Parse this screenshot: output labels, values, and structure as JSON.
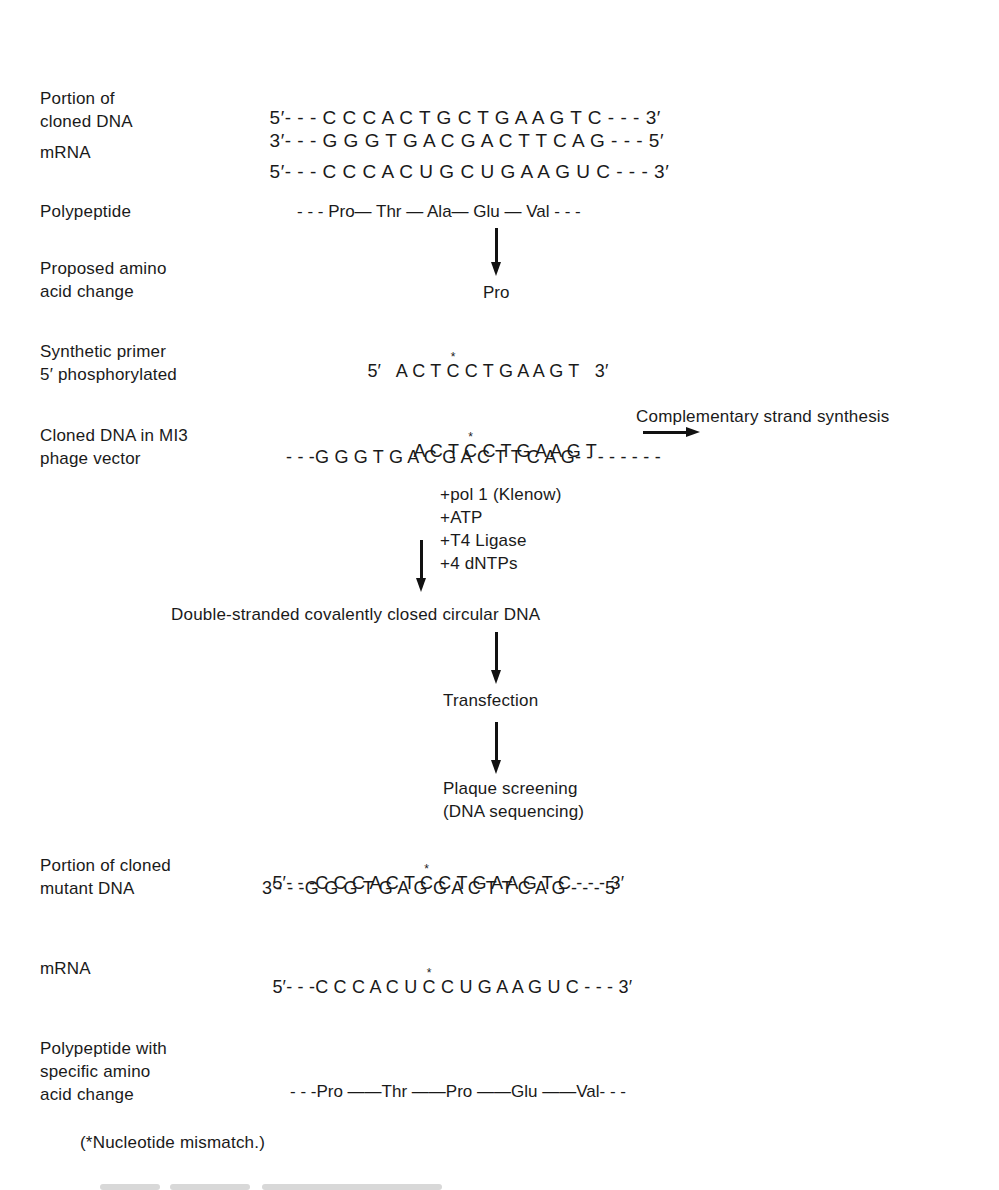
{
  "section1": {
    "label_line1": "Portion of",
    "label_line2": "cloned DNA",
    "strand_top": {
      "prefix": "5′- - - ",
      "bases": "C C C A C T G C T G A A G T C",
      "suffix": " - - - 3′"
    },
    "strand_bottom": {
      "prefix": "3′- - - ",
      "bases": "G G G T G A C G A C T T C A G",
      "suffix": " - - - 5′"
    }
  },
  "section2": {
    "label": "mRNA",
    "strand": {
      "prefix": "5′- - - ",
      "bases": "C C C A C U G C U G A A G U C",
      "suffix": " - - - 3′"
    }
  },
  "section3": {
    "label": "Polypeptide",
    "chain": "- - - Pro— Thr — Ala— Glu — Val - - -",
    "residues": [
      "Pro",
      "Thr",
      "Ala",
      "Glu",
      "Val"
    ]
  },
  "section4": {
    "label_line1": "Proposed amino",
    "label_line2": "acid change",
    "new_residue": "Pro"
  },
  "section5": {
    "label_line1": "Synthetic primer",
    "label_line2": "5′ phosphorylated",
    "five_prime": "5′",
    "bases_before": "A C T ",
    "mismatch_base": "C",
    "bases_after": " C T G A A G T",
    "three_prime": "3′"
  },
  "section6": {
    "label_line1": "Cloned DNA in MI3",
    "label_line2": "phage vector",
    "primer_before": "A C T ",
    "primer_mismatch": "C",
    "primer_after": " C T G A A G T",
    "template": "- - -G G G T G A C G A C T T C A G- - - - - - - -",
    "synthesis_label": "Complementary strand synthesis"
  },
  "reagents": [
    "+pol 1 (Klenow)",
    "+ATP",
    "+T4 Ligase",
    "+4 dNTPs"
  ],
  "steps": {
    "product": "Double-stranded covalently closed circular DNA",
    "transfection": "Transfection",
    "screening_line1": "Plaque screening",
    "screening_line2": "(DNA sequencing)"
  },
  "section7": {
    "label_line1": "Portion of cloned",
    "label_line2": "mutant DNA",
    "top_prefix": "5′- - -",
    "top_before": "C C C A C T ",
    "top_mismatch": "C",
    "top_after": " C T G A A G T C",
    "top_suffix": " - - - 3′",
    "bottom": "3′- - -G G G T G A G G A C T T C A G - - - 5′"
  },
  "section8": {
    "label": "mRNA",
    "prefix": "5′- - -",
    "before": "C C C A C U ",
    "mismatch": "C",
    "after": " C U G A A G U C",
    "suffix": " - - - 3′"
  },
  "section9": {
    "label_line1": "Polypeptide with",
    "label_line2": "specific amino",
    "label_line3": "acid change",
    "chain": "- - -Pro ——Thr ——Pro ——Glu ——Val- - -"
  },
  "footnote": "(*Nucleotide mismatch.)"
}
